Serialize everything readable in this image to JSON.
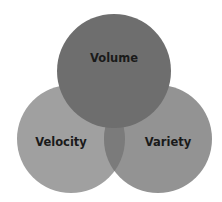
{
  "diagram": {
    "type": "venn",
    "sets": [
      {
        "id": "volume",
        "label": "Volume",
        "color": "#6e6e6e",
        "cx": 114,
        "cy": 71,
        "r": 57
      },
      {
        "id": "velocity",
        "label": "Velocity",
        "color": "#a0a0a0",
        "cx": 71,
        "cy": 139,
        "r": 54
      },
      {
        "id": "variety",
        "label": "Variety",
        "color": "#939393",
        "cx": 158,
        "cy": 139,
        "r": 54
      }
    ],
    "intersections": [
      {
        "sets": [
          "velocity",
          "variety"
        ],
        "color": "#7b7b7b"
      }
    ],
    "background": "#ffffff"
  }
}
